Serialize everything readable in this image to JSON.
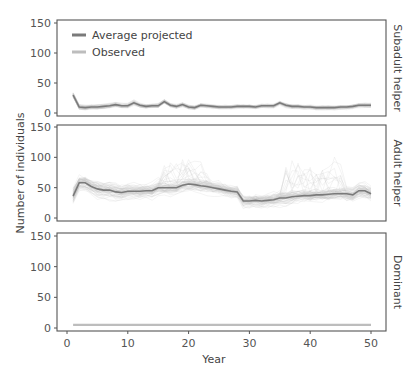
{
  "chart_data": {
    "type": "line",
    "layout": "3 vertically stacked panels sharing x-axis",
    "xlabel": "Year",
    "ylabel": "Number of individuals",
    "xlim": [
      0,
      50
    ],
    "xticks": [
      0,
      10,
      20,
      30,
      40,
      50
    ],
    "ylim": [
      0,
      150
    ],
    "yticks": [
      0,
      50,
      100,
      150
    ],
    "grid": false,
    "legend": {
      "position": "upper left of top panel",
      "entries": [
        {
          "label": "Average projected",
          "color": "#7a7a7a"
        },
        {
          "label": "Observed",
          "color": "#bdbdbd"
        }
      ]
    },
    "colors": {
      "average": "#7a7a7a",
      "observed": "#bdbdbd",
      "ensemble": "#c8c8c8",
      "frame": "#555555"
    },
    "panels": [
      {
        "name": "Subadult helper",
        "x": [
          1,
          2,
          3,
          4,
          5,
          6,
          7,
          8,
          9,
          10,
          11,
          12,
          13,
          14,
          15,
          16,
          17,
          18,
          19,
          20,
          21,
          22,
          23,
          24,
          25,
          26,
          27,
          28,
          29,
          30,
          31,
          32,
          33,
          34,
          35,
          36,
          37,
          38,
          39,
          40,
          41,
          42,
          43,
          44,
          45,
          46,
          47,
          48,
          49,
          50
        ],
        "average_projected": [
          30,
          10,
          9,
          10,
          10,
          11,
          12,
          14,
          12,
          12,
          17,
          13,
          11,
          12,
          12,
          19,
          13,
          11,
          14,
          10,
          9,
          13,
          12,
          11,
          10,
          10,
          10,
          11,
          11,
          11,
          10,
          12,
          12,
          12,
          17,
          13,
          11,
          11,
          10,
          10,
          9,
          9,
          9,
          9,
          10,
          10,
          11,
          13,
          13,
          13
        ],
        "ensemble_range": {
          "low": 3,
          "high": 40
        }
      },
      {
        "name": "Adult helper",
        "x": [
          1,
          2,
          3,
          4,
          5,
          6,
          7,
          8,
          9,
          10,
          11,
          12,
          13,
          14,
          15,
          16,
          17,
          18,
          19,
          20,
          21,
          22,
          23,
          24,
          25,
          26,
          27,
          28,
          29,
          30,
          31,
          32,
          33,
          34,
          35,
          36,
          37,
          38,
          39,
          40,
          41,
          42,
          43,
          44,
          45,
          46,
          47,
          48,
          49,
          50
        ],
        "average_projected": [
          36,
          58,
          58,
          52,
          48,
          46,
          46,
          43,
          42,
          44,
          44,
          44,
          45,
          45,
          50,
          50,
          50,
          50,
          54,
          56,
          55,
          53,
          52,
          50,
          48,
          46,
          44,
          43,
          28,
          28,
          29,
          28,
          29,
          30,
          33,
          33,
          35,
          36,
          37,
          37,
          38,
          38,
          39,
          40,
          40,
          40,
          38,
          45,
          45,
          40
        ],
        "ensemble_range": {
          "low": 15,
          "high": 135
        }
      },
      {
        "name": "Dominant",
        "x": [
          1,
          50
        ],
        "observed": [
          5,
          5
        ],
        "average_projected": [
          5,
          5
        ]
      }
    ]
  }
}
